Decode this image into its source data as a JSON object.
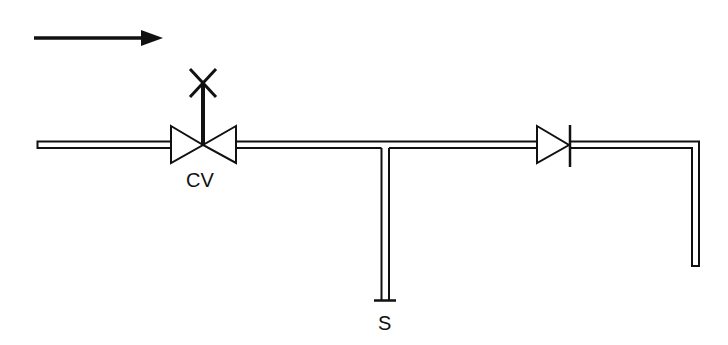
{
  "diagram": {
    "type": "piping-schematic",
    "flow_direction": "left-to-right",
    "colors": {
      "line": "#111111",
      "background": "#ffffff",
      "pipe_fill": "#ffffff"
    },
    "labels": {
      "control_valve": "CV",
      "sample_point": "S"
    },
    "components": [
      {
        "id": "flow-arrow",
        "kind": "arrow",
        "meaning": "flow direction"
      },
      {
        "id": "inlet-pipe",
        "kind": "pipe"
      },
      {
        "id": "control-valve",
        "kind": "globe/control valve with manual actuator",
        "label": "CV"
      },
      {
        "id": "main-pipe",
        "kind": "pipe"
      },
      {
        "id": "sample-branch",
        "kind": "pipe branch (tee) with capped end",
        "label": "S"
      },
      {
        "id": "check-valve",
        "kind": "check valve"
      },
      {
        "id": "outlet-pipe",
        "kind": "pipe with downward elbow"
      }
    ]
  }
}
